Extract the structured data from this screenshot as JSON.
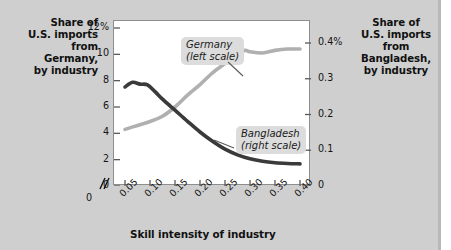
{
  "figure": {
    "left_axis_title": "Share of\nU.S. imports\nfrom\nGermany,\nby industry",
    "right_axis_title": "Share of\nU.S. imports\nfrom\nBangladesh,\nby industry",
    "x_axis_title": "Skill intensity of industry",
    "background_color": "#cfcfcf",
    "plot_background_color": "#ffffff"
  },
  "callouts": {
    "germany": {
      "name": "Germany",
      "scale": "(left scale)"
    },
    "bangladesh": {
      "name": "Bangladesh",
      "scale": "(right scale)"
    }
  },
  "axes": {
    "left_ticks": [
      "12%",
      "10",
      "8",
      "6",
      "4",
      "2",
      "0"
    ],
    "right_ticks": [
      "0.4%",
      "0.3",
      "0.2",
      "0.1",
      "0"
    ],
    "x_ticks": [
      "0",
      "0.05",
      "0.10",
      "0.15",
      "0.20",
      "0.25",
      "0.30",
      "0.35",
      "0.40"
    ],
    "x_break_marker": "//"
  },
  "chart_data": {
    "type": "line",
    "title": "",
    "subtitle": "",
    "xlabel": "Skill intensity of industry",
    "ylabel": "Share of U.S. imports from Germany, by industry",
    "y2label": "Share of U.S. imports from Bangladesh, by industry",
    "xlim": [
      0.05,
      0.4
    ],
    "ylim": [
      0,
      12
    ],
    "y2lim": [
      0,
      0.4
    ],
    "xticks": [
      0.05,
      0.1,
      0.15,
      0.2,
      0.25,
      0.3,
      0.35,
      0.4
    ],
    "yticks": [
      0,
      2,
      4,
      6,
      8,
      10,
      12
    ],
    "y2ticks": [
      0,
      0.1,
      0.2,
      0.3,
      0.4
    ],
    "grid": false,
    "legend": "inline-callouts",
    "x_axis_break": true,
    "series": [
      {
        "name": "Germany",
        "axis": "left",
        "color": "#b0b0b0",
        "unit": "%",
        "x": [
          0.05,
          0.075,
          0.1,
          0.125,
          0.15,
          0.175,
          0.2,
          0.225,
          0.25,
          0.275,
          0.29,
          0.3,
          0.325,
          0.35,
          0.375,
          0.4
        ],
        "values": [
          4.3,
          4.6,
          4.9,
          5.3,
          6.0,
          6.9,
          7.7,
          8.6,
          9.3,
          10.0,
          10.3,
          10.2,
          10.1,
          10.3,
          10.4,
          10.4
        ]
      },
      {
        "name": "Bangladesh",
        "axis": "right",
        "color": "#3a3a3a",
        "unit": "%",
        "x": [
          0.05,
          0.065,
          0.08,
          0.095,
          0.11,
          0.125,
          0.15,
          0.175,
          0.2,
          0.225,
          0.25,
          0.275,
          0.3,
          0.325,
          0.35,
          0.375,
          0.4
        ],
        "values": [
          0.277,
          0.29,
          0.285,
          0.283,
          0.264,
          0.243,
          0.212,
          0.181,
          0.151,
          0.125,
          0.103,
          0.087,
          0.076,
          0.069,
          0.065,
          0.063,
          0.062
        ]
      }
    ]
  }
}
